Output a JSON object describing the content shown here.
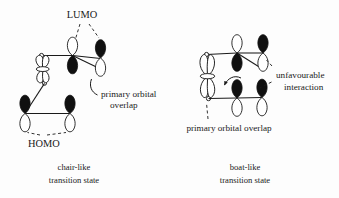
{
  "figure": {
    "domain_kind": "chemistry-orbital-diagram",
    "background_color": "#fdfdfd",
    "ink_color": "#1a1a1a",
    "lobe_filled_color": "#101010",
    "lobe_empty_color": "#ffffff"
  },
  "labels": {
    "lumo": "LUMO",
    "homo": "HOMO",
    "primary_overlap_left_line1": "primary orbital",
    "primary_overlap_left_line2": "overlap",
    "unfavourable_line1": "unfavourable",
    "unfavourable_line2": "interaction",
    "primary_overlap_right": "primary orbital overlap"
  },
  "captions": {
    "left_line1": "chair-like",
    "left_line2": "transition state",
    "right_line1": "boat-like",
    "right_line2": "transition state"
  },
  "structures": [
    {
      "name": "chair-like-transition-state",
      "caption": "chair-like transition state",
      "fragments": [
        {
          "name": "lumo-fragment",
          "label": "LUMO",
          "orbital_count": 3
        },
        {
          "name": "homo-fragment",
          "label": "HOMO",
          "orbital_count": 3
        }
      ],
      "annotations": [
        "primary orbital overlap"
      ]
    },
    {
      "name": "boat-like-transition-state",
      "caption": "boat-like transition state",
      "fragments": [
        {
          "name": "upper-fragment",
          "orbital_count": 3
        },
        {
          "name": "lower-fragment",
          "orbital_count": 3
        }
      ],
      "annotations": [
        "unfavourable interaction",
        "primary orbital overlap"
      ]
    }
  ]
}
